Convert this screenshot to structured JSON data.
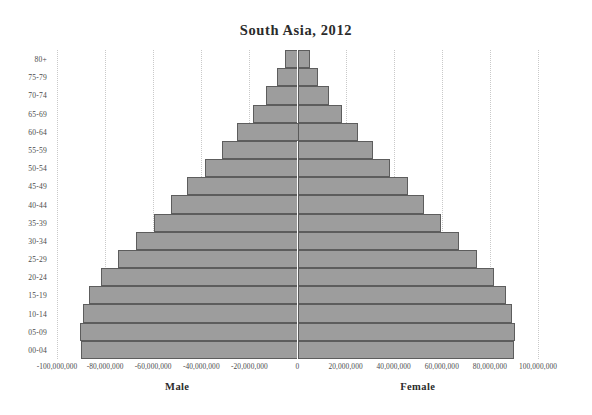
{
  "chart_data": {
    "type": "bar",
    "title": "South Asia, 2012",
    "subtitle": "",
    "xlabel": "",
    "ylabel": "",
    "orientation": "horizontal",
    "style": "population-pyramid",
    "grid": true,
    "legend_position": "none",
    "xlim": [
      -100000000,
      100000000
    ],
    "xtick_values": [
      -100000000,
      -80000000,
      -60000000,
      -40000000,
      -20000000,
      0,
      20000000,
      40000000,
      60000000,
      80000000,
      100000000
    ],
    "xtick_labels": [
      "-100,000,000",
      "-80,000,000",
      "-60,000,000",
      "-40,000,000",
      "-20,000,000",
      "0",
      "20,000,000",
      "40,000,000",
      "60,000,000",
      "80,000,000",
      "100,000,000"
    ],
    "categories": [
      "80+",
      "75-79",
      "70-74",
      "65-69",
      "60-64",
      "55-59",
      "50-54",
      "45-49",
      "40-44",
      "35-39",
      "30-34",
      "25-29",
      "20-24",
      "15-19",
      "10-14",
      "05-09",
      "00-04"
    ],
    "series": [
      {
        "name": "Male",
        "side": "left",
        "values": [
          -5000000,
          -8500000,
          -13000000,
          -18500000,
          -25000000,
          -31500000,
          -38500000,
          -46000000,
          -52500000,
          -59500000,
          -67000000,
          -74500000,
          -81500000,
          -86500000,
          -89000000,
          -90500000,
          -90000000
        ]
      },
      {
        "name": "Female",
        "side": "right",
        "values": [
          5000000,
          8500000,
          13000000,
          18500000,
          25000000,
          31500000,
          38500000,
          46000000,
          52500000,
          59500000,
          67000000,
          74500000,
          81500000,
          86500000,
          89000000,
          90500000,
          90000000
        ]
      }
    ],
    "axis_labels": {
      "male": "Male",
      "female": "Female"
    },
    "colors": {
      "bar_fill": "#9d9d9d",
      "bar_border": "#5d5d5d",
      "gridline": "#c9c9c9",
      "zero_axis": "#5a5a5a",
      "text": "#4a4a4a",
      "title": "#2b2b2b",
      "background": "#ffffff"
    }
  }
}
